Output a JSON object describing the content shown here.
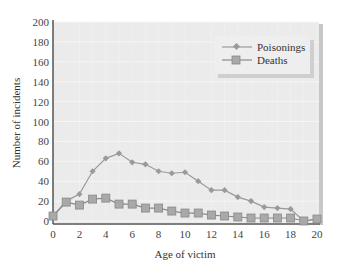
{
  "chart_data": {
    "type": "line",
    "title": "",
    "xlabel": "Age of victim",
    "ylabel": "Number of incidents",
    "x": [
      0,
      1,
      2,
      3,
      4,
      5,
      6,
      7,
      8,
      9,
      10,
      11,
      12,
      13,
      14,
      15,
      16,
      17,
      18,
      19,
      20
    ],
    "xlim": [
      0,
      20
    ],
    "ylim": [
      0,
      200
    ],
    "xticks": [
      0,
      2,
      4,
      6,
      8,
      10,
      12,
      14,
      16,
      18,
      20
    ],
    "yticks": [
      0,
      20,
      40,
      60,
      80,
      100,
      120,
      140,
      160,
      180,
      200
    ],
    "grid": true,
    "legend_position": "upper right",
    "series": [
      {
        "name": "Poisonings",
        "marker": "diamond",
        "values": [
          5,
          20,
          27,
          50,
          63,
          68,
          59,
          57,
          50,
          48,
          49,
          40,
          31,
          31,
          24,
          20,
          14,
          13,
          12,
          0,
          2
        ]
      },
      {
        "name": "Deaths",
        "marker": "square",
        "values": [
          5,
          19,
          16,
          22,
          23,
          17,
          17,
          13,
          13,
          10,
          8,
          8,
          6,
          5,
          4,
          3,
          3,
          3,
          3,
          0,
          2
        ]
      }
    ]
  },
  "colors": {
    "plot_bg": "#ebebeb",
    "grid": "#f6f6f6",
    "axis": "#555555",
    "poison_line": "#9a9a9a",
    "death_marker": "#a9a9a9"
  }
}
